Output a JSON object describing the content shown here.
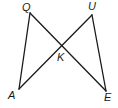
{
  "diagram": {
    "type": "geometry",
    "points": {
      "Q": {
        "label": "Q",
        "x": 30,
        "y": 13,
        "lx": 22,
        "ly": 11
      },
      "U": {
        "label": "U",
        "x": 92,
        "y": 15,
        "lx": 88,
        "ly": 10
      },
      "K": {
        "label": "K",
        "x": 61,
        "y": 45,
        "lx": 57,
        "ly": 61
      },
      "A": {
        "label": "A",
        "x": 19,
        "y": 89,
        "lx": 8,
        "ly": 99
      },
      "E": {
        "label": "E",
        "x": 106,
        "y": 91,
        "lx": 104,
        "ly": 101
      }
    },
    "segments": [
      {
        "from": "Q",
        "to": "A"
      },
      {
        "from": "Q",
        "to": "E"
      },
      {
        "from": "U",
        "to": "A"
      },
      {
        "from": "U",
        "to": "E"
      }
    ]
  }
}
